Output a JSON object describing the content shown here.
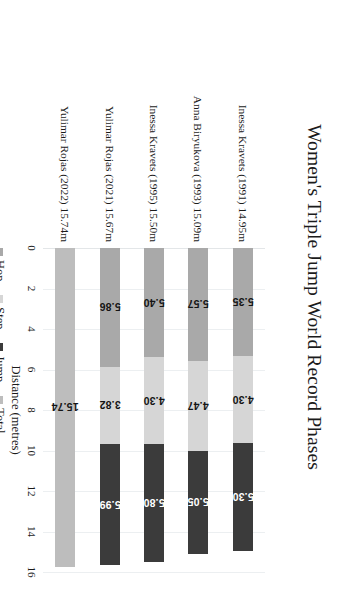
{
  "chart_data": {
    "type": "bar",
    "orientation": "horizontal",
    "stacked": true,
    "title": "Women's Triple Jump World Record Phases",
    "xlabel": "Distance (metres)",
    "ylabel": "",
    "xlim": [
      0,
      16
    ],
    "xticks": [
      0,
      2,
      4,
      6,
      8,
      10,
      12,
      14,
      16
    ],
    "xtick_labels": [
      "0",
      "2",
      "4",
      "6",
      "8",
      "10",
      "12",
      "14",
      "16"
    ],
    "grid": true,
    "legend_position": "bottom-left",
    "categories": [
      "Inessa Kravets (1991) 14.95m",
      "Anna Biryukova (1993) 15.09m",
      "Inessa Kravets (1995) 15.50m",
      "Yulimar Rojas (2021) 15.67m",
      "Yulimar Rojas (2022) 15.74m"
    ],
    "series": [
      {
        "name": "Hop",
        "color": "#a9a9a9",
        "values": [
          5.35,
          5.57,
          5.4,
          5.86,
          null
        ],
        "labels": [
          "5.35",
          "5.57",
          "5.40",
          "5.86",
          ""
        ]
      },
      {
        "name": "Step",
        "color": "#d6d6d6",
        "values": [
          4.3,
          4.47,
          4.3,
          3.82,
          null
        ],
        "labels": [
          "4.30",
          "4.47",
          "4.30",
          "3.82",
          ""
        ]
      },
      {
        "name": "Jump",
        "color": "#3b3b3b",
        "values": [
          5.3,
          5.05,
          5.8,
          5.99,
          null
        ],
        "labels": [
          "5.30",
          "5.05",
          "5.80",
          "5.99",
          ""
        ]
      },
      {
        "name": "Total",
        "color": "#bdbdbd",
        "values": [
          null,
          null,
          null,
          null,
          15.74
        ],
        "labels": [
          "",
          "",
          "",
          "",
          "15.74"
        ]
      }
    ],
    "legend": [
      {
        "label": "Hop",
        "color": "#a9a9a9"
      },
      {
        "label": "Step",
        "color": "#d6d6d6"
      },
      {
        "label": "Jump",
        "color": "#3b3b3b"
      },
      {
        "label": "Total",
        "color": "#bdbdbd"
      }
    ]
  }
}
